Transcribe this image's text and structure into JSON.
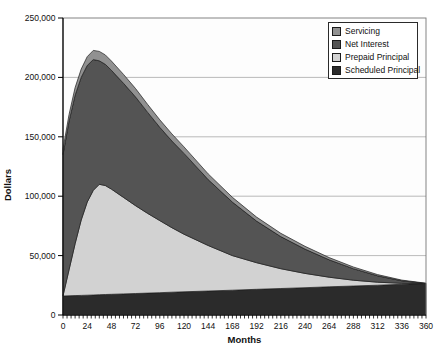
{
  "chart_data": {
    "type": "area",
    "stacked": true,
    "title": "",
    "xlabel": "Months",
    "ylabel": "Dollars",
    "xlim": [
      0,
      360
    ],
    "ylim": [
      0,
      250000
    ],
    "grid": "horizontal",
    "legend_position": "top-right",
    "legend_order": "top-series-first",
    "x": [
      0,
      6,
      12,
      18,
      24,
      30,
      36,
      42,
      48,
      60,
      72,
      84,
      96,
      108,
      120,
      144,
      168,
      192,
      216,
      240,
      264,
      288,
      312,
      336,
      360
    ],
    "series": [
      {
        "name": "Scheduled Principal",
        "color": "#2b2b2b",
        "values": [
          16000,
          16175,
          16350,
          16525,
          16700,
          16875,
          17050,
          17225,
          17400,
          17750,
          18100,
          18450,
          18800,
          19150,
          19500,
          20200,
          20900,
          21600,
          22300,
          23000,
          23700,
          24400,
          25100,
          25800,
          26500
        ]
      },
      {
        "name": "Prepaid Principal",
        "color": "#d2d2d2",
        "values": [
          200,
          21825,
          43650,
          63475,
          78300,
          88125,
          92950,
          91775,
          88600,
          81250,
          73900,
          67050,
          60700,
          54350,
          48500,
          38300,
          29100,
          22400,
          16700,
          12000,
          8100,
          4900,
          2500,
          900,
          0
        ]
      },
      {
        "name": "Net Interest",
        "color": "#545454",
        "values": [
          118800,
          125000,
          125000,
          120000,
          115000,
          110000,
          104000,
          102000,
          100000,
          96000,
          91500,
          85000,
          78500,
          73000,
          68000,
          55500,
          45000,
          35000,
          27000,
          20500,
          14700,
          9700,
          5400,
          2100,
          0
        ]
      },
      {
        "name": "Servicing",
        "color": "#919191",
        "values": [
          4800,
          5600,
          6400,
          7000,
          7400,
          7700,
          7900,
          7900,
          7800,
          7500,
          7100,
          6700,
          6300,
          5900,
          5500,
          4800,
          4100,
          3400,
          2800,
          2300,
          1800,
          1400,
          1000,
          600,
          300
        ]
      }
    ],
    "xticks": [
      0,
      24,
      48,
      72,
      96,
      120,
      144,
      168,
      192,
      216,
      240,
      264,
      288,
      312,
      336,
      360
    ],
    "xtick_labels": [
      "0",
      "24",
      "48",
      "72",
      "96",
      "120",
      "144",
      "168",
      "192",
      "216",
      "240",
      "264",
      "288",
      "312",
      "336",
      "360"
    ],
    "x_minor_tick_step": 4,
    "yticks": [
      0,
      50000,
      100000,
      150000,
      200000,
      250000
    ],
    "ytick_labels": [
      "0",
      "50,000",
      "100,000",
      "150,000",
      "200,000",
      "250,000"
    ]
  }
}
